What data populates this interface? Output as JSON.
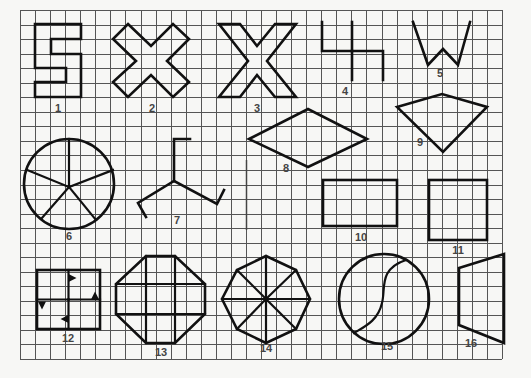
{
  "grid": {
    "x0": 20,
    "y0": 10,
    "x1": 502,
    "y1": 359,
    "cols": 32,
    "rows": 24,
    "line_color": "#555555",
    "background": "#f7f7f5",
    "divider_x_col": 15
  },
  "figures": [
    {
      "id": 1,
      "label": "1",
      "type": "polygon",
      "points": [
        [
          35,
          24
        ],
        [
          81,
          24
        ],
        [
          81,
          39
        ],
        [
          51,
          39
        ],
        [
          51,
          54
        ],
        [
          81,
          54
        ],
        [
          81,
          97
        ],
        [
          35,
          97
        ],
        [
          35,
          82
        ],
        [
          66,
          82
        ],
        [
          66,
          68
        ],
        [
          35,
          68
        ]
      ],
      "label_pos": [
        58,
        112
      ]
    },
    {
      "id": 2,
      "label": "2",
      "type": "polygon",
      "points": [
        [
          128,
          24
        ],
        [
          151,
          46
        ],
        [
          173,
          24
        ],
        [
          189,
          39
        ],
        [
          167,
          61
        ],
        [
          189,
          82
        ],
        [
          173,
          97
        ],
        [
          151,
          75
        ],
        [
          128,
          97
        ],
        [
          113,
          82
        ],
        [
          136,
          61
        ],
        [
          113,
          39
        ]
      ],
      "label_pos": [
        152,
        112
      ]
    },
    {
      "id": 3,
      "label": "3",
      "type": "polygon",
      "points": [
        [
          219,
          24
        ],
        [
          240,
          24
        ],
        [
          257,
          46
        ],
        [
          275,
          24
        ],
        [
          296,
          24
        ],
        [
          267,
          61
        ],
        [
          296,
          97
        ],
        [
          275,
          97
        ],
        [
          257,
          75
        ],
        [
          240,
          97
        ],
        [
          219,
          97
        ],
        [
          248,
          61
        ]
      ],
      "label_pos": [
        257,
        112
      ]
    },
    {
      "id": 4,
      "label": "4",
      "type": "polyline",
      "points": [
        [
          [
            322,
            22
          ],
          [
            322,
            51
          ],
          [
            352,
            51
          ],
          [
            352,
            80
          ]
        ],
        [
          [
            352,
            22
          ],
          [
            352,
            51
          ]
        ],
        [
          [
            352,
            51
          ],
          [
            383,
            51
          ],
          [
            383,
            80
          ]
        ]
      ],
      "label_pos": [
        345,
        95
      ]
    },
    {
      "id": 5,
      "label": "5",
      "type": "polyline",
      "points": [
        [
          [
            413,
            22
          ],
          [
            428,
            65
          ],
          [
            443,
            49
          ],
          [
            458,
            65
          ],
          [
            470,
            22
          ]
        ]
      ],
      "label_pos": [
        440,
        77
      ]
    },
    {
      "id": 6,
      "label": "6",
      "type": "circle-spokes",
      "center": [
        69,
        184
      ],
      "radius": 45,
      "spokes": [
        [
          69,
          139
        ],
        [
          113,
          170
        ],
        [
          96,
          220
        ],
        [
          42,
          218
        ],
        [
          27,
          170
        ]
      ],
      "label_pos": [
        69,
        240
      ]
    },
    {
      "id": 7,
      "label": "7",
      "type": "polyline",
      "points": [
        [
          [
            174,
            181
          ],
          [
            174,
            139
          ],
          [
            190,
            139
          ]
        ],
        [
          [
            174,
            181
          ],
          [
            138,
            203
          ],
          [
            146,
            217
          ]
        ],
        [
          [
            174,
            181
          ],
          [
            217,
            204
          ],
          [
            224,
            190
          ]
        ]
      ],
      "label_pos": [
        177,
        224
      ]
    },
    {
      "id": 8,
      "label": "8",
      "type": "polygon",
      "points": [
        [
          249,
          139
        ],
        [
          308,
          109
        ],
        [
          367,
          139
        ],
        [
          308,
          167
        ]
      ],
      "label_pos": [
        286,
        172
      ]
    },
    {
      "id": 9,
      "label": "9",
      "type": "polygon",
      "points": [
        [
          397,
          107
        ],
        [
          442,
          94
        ],
        [
          487,
          107
        ],
        [
          443,
          152
        ]
      ],
      "label_pos": [
        420,
        146
      ]
    },
    {
      "id": 10,
      "label": "10",
      "type": "rect",
      "x": 323,
      "y": 180,
      "w": 74,
      "h": 46,
      "label_pos": [
        361,
        241
      ]
    },
    {
      "id": 11,
      "label": "11",
      "type": "rect",
      "x": 429,
      "y": 180,
      "w": 58,
      "h": 60,
      "label_pos": [
        458,
        254
      ]
    },
    {
      "id": 12,
      "label": "12",
      "type": "pinwheel-square",
      "x": 37,
      "y": 270,
      "w": 63,
      "h": 59,
      "label_pos": [
        68,
        342
      ]
    },
    {
      "id": 13,
      "label": "13",
      "type": "octagon-grid",
      "points": [
        [
          146,
          256
        ],
        [
          175,
          256
        ],
        [
          205,
          284
        ],
        [
          205,
          314
        ],
        [
          175,
          343
        ],
        [
          146,
          343
        ],
        [
          116,
          314
        ],
        [
          116,
          284
        ]
      ],
      "inner_v": [
        146,
        175
      ],
      "inner_h": [
        284,
        314
      ],
      "label_pos": [
        161,
        356
      ]
    },
    {
      "id": 14,
      "label": "14",
      "type": "octagon-spokes",
      "center": [
        266,
        299
      ],
      "points": [
        [
          266,
          256
        ],
        [
          296,
          270
        ],
        [
          310,
          299
        ],
        [
          296,
          329
        ],
        [
          266,
          343
        ],
        [
          237,
          329
        ],
        [
          222,
          299
        ],
        [
          237,
          270
        ]
      ],
      "label_pos": [
        266,
        352
      ]
    },
    {
      "id": 15,
      "label": "15",
      "type": "circle-s",
      "center": [
        384,
        299
      ],
      "radius": 45,
      "label_pos": [
        387,
        350
      ]
    },
    {
      "id": 16,
      "label": "16",
      "type": "polygon",
      "points": [
        [
          459,
          268
        ],
        [
          504,
          254
        ],
        [
          504,
          343
        ],
        [
          459,
          325
        ]
      ],
      "label_pos": [
        471,
        347
      ]
    }
  ]
}
